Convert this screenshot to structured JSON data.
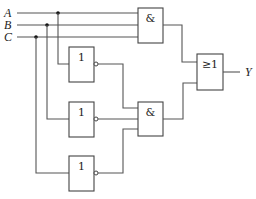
{
  "diagram": {
    "type": "logic-circuit",
    "inputs": [
      {
        "id": "A",
        "label": "A"
      },
      {
        "id": "B",
        "label": "B"
      },
      {
        "id": "C",
        "label": "C"
      }
    ],
    "output": {
      "id": "Y",
      "label": "Y"
    },
    "gates": [
      {
        "id": "and1",
        "type": "AND",
        "symbol": "&",
        "inputs": [
          "A",
          "B",
          "C"
        ]
      },
      {
        "id": "not1",
        "type": "NOT",
        "symbol": "1",
        "inputs": [
          "A"
        ]
      },
      {
        "id": "not2",
        "type": "NOT",
        "symbol": "1",
        "inputs": [
          "B"
        ]
      },
      {
        "id": "not3",
        "type": "NOT",
        "symbol": "1",
        "inputs": [
          "C"
        ]
      },
      {
        "id": "and2",
        "type": "AND",
        "symbol": "&",
        "inputs": [
          "not1",
          "not2",
          "not3"
        ]
      },
      {
        "id": "or1",
        "type": "OR",
        "symbol": "≥1",
        "inputs": [
          "and1",
          "and2"
        ]
      }
    ],
    "colors": {
      "wire": "#555555",
      "gate_border": "#444444",
      "junction": "#111111",
      "background": "#ffffff"
    }
  }
}
